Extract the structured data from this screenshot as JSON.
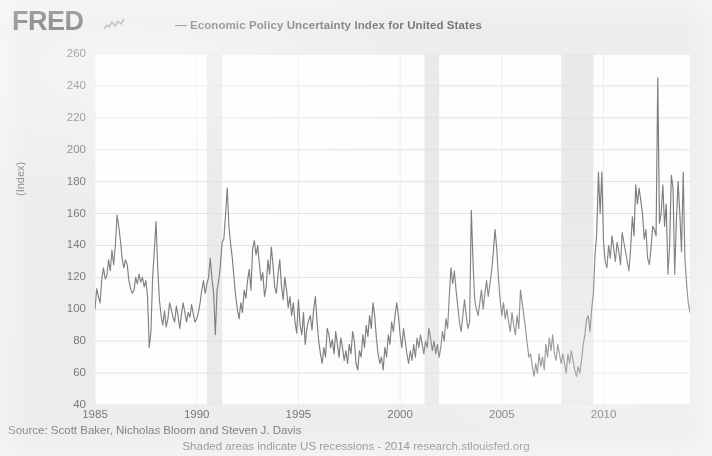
{
  "header": {
    "logo_text": "FRED",
    "logo_icon": "squiggle-line-icon",
    "legend_marker": "line-swatch-icon",
    "legend_label": "— Economic Policy Uncertainty Index for United States"
  },
  "footer": {
    "source": "Source: Scott Baker, Nicholas Bloom and Steven J. Davis",
    "note": "Shaded areas indicate US recessions - 2014 research.stlouisfed.org"
  },
  "colors": {
    "page_background": "#e8e8e6",
    "plot_background": "#fdfdfd",
    "series_line": "#5a5d62",
    "gridline": "#d8dade",
    "recession_band": "#e4e4e2",
    "text": "#4f5256",
    "logo": "#35383c"
  },
  "chart_data": {
    "type": "line",
    "title": "Economic Policy Uncertainty Index for United States",
    "xlabel": "",
    "ylabel": "(Index)",
    "ylim": [
      40,
      260
    ],
    "xlim": [
      1985.0,
      2014.25
    ],
    "ytick_labels": [
      260,
      240,
      220,
      200,
      180,
      160,
      140,
      120,
      100,
      80,
      60,
      40
    ],
    "xtick_labels": [
      1985,
      1990,
      1995,
      2000,
      2005,
      2010
    ],
    "grid": true,
    "legend_position": "top-center",
    "annotations": [
      "Shaded areas indicate US recessions"
    ],
    "recession_bands": [
      {
        "start": 1990.5,
        "end": 1991.25,
        "label": "1990-1991 recession"
      },
      {
        "start": 2001.2,
        "end": 2001.92,
        "label": "2001 recession"
      },
      {
        "start": 2007.92,
        "end": 2009.5,
        "label": "2007-2009 recession"
      }
    ],
    "series": [
      {
        "name": "Economic Policy Uncertainty Index for United States",
        "color": "#5a5d62",
        "x_start": 1985.0,
        "x_step": 0.08333,
        "values": [
          100,
          113,
          108,
          104,
          119,
          126,
          119,
          121,
          131,
          124,
          137,
          128,
          140,
          159,
          152,
          143,
          132,
          126,
          131,
          128,
          118,
          113,
          110,
          112,
          120,
          116,
          122,
          117,
          120,
          114,
          118,
          108,
          76,
          86,
          120,
          137,
          155,
          126,
          106,
          96,
          90,
          99,
          89,
          94,
          104,
          100,
          95,
          92,
          102,
          96,
          88,
          97,
          104,
          98,
          92,
          98,
          95,
          103,
          97,
          92,
          94,
          98,
          104,
          112,
          118,
          110,
          116,
          120,
          132,
          119,
          110,
          84,
          112,
          118,
          128,
          142,
          144,
          159,
          176,
          152,
          141,
          132,
          120,
          108,
          100,
          94,
          104,
          98,
          112,
          107,
          118,
          125,
          112,
          138,
          143,
          134,
          140,
          128,
          118,
          123,
          108,
          114,
          131,
          122,
          139,
          128,
          114,
          110,
          122,
          131,
          115,
          106,
          120,
          112,
          101,
          108,
          96,
          104,
          92,
          85,
          106,
          90,
          84,
          98,
          78,
          88,
          93,
          96,
          87,
          100,
          108,
          92,
          80,
          72,
          66,
          76,
          70,
          88,
          84,
          76,
          81,
          72,
          86,
          78,
          70,
          82,
          76,
          68,
          74,
          66,
          78,
          72,
          86,
          80,
          66,
          62,
          74,
          70,
          84,
          76,
          90,
          83,
          96,
          88,
          104,
          96,
          82,
          72,
          66,
          70,
          62,
          76,
          70,
          84,
          78,
          92,
          86,
          96,
          104,
          96,
          84,
          76,
          88,
          80,
          72,
          66,
          74,
          68,
          78,
          70,
          82,
          76,
          84,
          78,
          72,
          80,
          76,
          88,
          82,
          74,
          80,
          72,
          78,
          70,
          76,
          86,
          80,
          94,
          88,
          108,
          126,
          116,
          124,
          112,
          102,
          92,
          86,
          96,
          106,
          96,
          88,
          92,
          162,
          130,
          106,
          100,
          96,
          104,
          112,
          100,
          110,
          118,
          108,
          116,
          124,
          136,
          150,
          138,
          120,
          106,
          96,
          104,
          94,
          100,
          92,
          86,
          98,
          90,
          84,
          96,
          88,
          112,
          104,
          96,
          88,
          78,
          70,
          72,
          64,
          58,
          66,
          60,
          72,
          64,
          70,
          62,
          78,
          70,
          82,
          74,
          84,
          72,
          68,
          78,
          72,
          66,
          72,
          66,
          60,
          72,
          66,
          74,
          68,
          62,
          58,
          64,
          60,
          68,
          78,
          84,
          94,
          96,
          86,
          100,
          110,
          134,
          148,
          186,
          160,
          186,
          142,
          130,
          126,
          140,
          132,
          146,
          138,
          130,
          142,
          136,
          128,
          148,
          142,
          136,
          130,
          124,
          138,
          158,
          146,
          178,
          166,
          176,
          168,
          160,
          144,
          150,
          132,
          128,
          138,
          152,
          150,
          146,
          245,
          154,
          160,
          178,
          152,
          166,
          122,
          140,
          184,
          176,
          122,
          156,
          180,
          160,
          136,
          186,
          132,
          116,
          104,
          98,
          112,
          108,
          96,
          92,
          104,
          88,
          178,
          94,
          86,
          82,
          88,
          78,
          72,
          70
        ]
      }
    ]
  },
  "ui": {
    "y_axis_title": "(Index)"
  }
}
